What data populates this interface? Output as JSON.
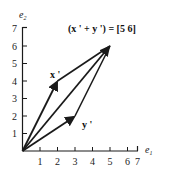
{
  "diagram": {
    "type": "vector-addition-parallelogram",
    "axes": {
      "x_label": "e",
      "x_label_sub": "1",
      "y_label": "e",
      "y_label_sub": "2",
      "x_ticks": [
        "1",
        "2",
        "3",
        "4",
        "5",
        "6",
        "7"
      ],
      "y_ticks": [
        "1",
        "2",
        "3",
        "4",
        "5",
        "6",
        "7"
      ],
      "range": [
        0,
        7
      ]
    },
    "vectors": [
      {
        "name": "x'",
        "label": "x '",
        "from": [
          0,
          0
        ],
        "to": [
          2,
          4
        ]
      },
      {
        "name": "y'",
        "label": "y '",
        "from": [
          0,
          0
        ],
        "to": [
          3,
          2
        ]
      },
      {
        "name": "x'+y'",
        "from": [
          0,
          0
        ],
        "to": [
          5,
          6
        ]
      }
    ],
    "parallelogram_edges": [
      {
        "from": [
          2,
          4
        ],
        "to": [
          5,
          6
        ]
      },
      {
        "from": [
          3,
          2
        ],
        "to": [
          5,
          6
        ]
      }
    ],
    "equation": "(x ' + y ') = [5 6]",
    "colors": {
      "ink": "#1a1a1a",
      "background": "#ffffff"
    }
  }
}
